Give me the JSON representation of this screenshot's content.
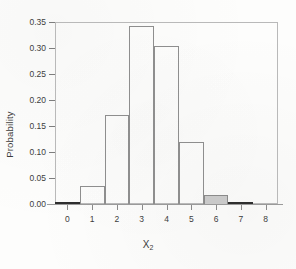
{
  "chart_data": {
    "type": "bar",
    "title": "",
    "subtitle": "",
    "xlabel": "X",
    "xlabel_sub": "2",
    "ylabel": "Probability",
    "categories": [
      0,
      1,
      2,
      3,
      4,
      5,
      6,
      7,
      8
    ],
    "values": [
      0.002,
      0.035,
      0.171,
      0.342,
      0.304,
      0.12,
      0.018,
      0.002,
      0.0
    ],
    "highlighted_categories": [
      6
    ],
    "highlight_color": "#c9c9c9",
    "bar_edge_color": "#8e8e8e",
    "bar_fill_color": "#ffffff",
    "xlim": [
      -0.5,
      8.5
    ],
    "ylim": [
      0.0,
      0.35
    ],
    "xticks": [
      0,
      1,
      2,
      3,
      4,
      5,
      6,
      7,
      8
    ],
    "xtick_labels": [
      "0",
      "1",
      "2",
      "3",
      "4",
      "5",
      "6",
      "7",
      "8"
    ],
    "yticks": [
      0.0,
      0.05,
      0.1,
      0.15,
      0.2,
      0.25,
      0.3,
      0.35
    ],
    "ytick_labels": [
      "0.00",
      "0.05",
      "0.10",
      "0.15",
      "0.20",
      "0.25",
      "0.30",
      "0.35"
    ],
    "grid": false,
    "legend": null,
    "bar_width": 1.0,
    "annotations": []
  }
}
